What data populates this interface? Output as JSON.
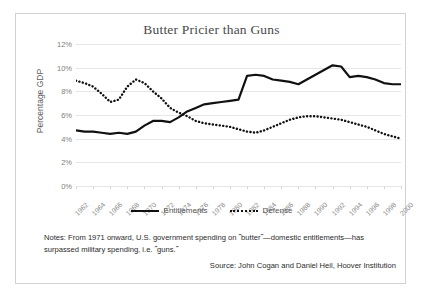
{
  "frame": {
    "border_color": "#d2d2d2"
  },
  "chart_data": {
    "type": "line",
    "title": "Butter Pricier than Guns",
    "xlabel": "",
    "ylabel": "Percentage GDP",
    "ylim": [
      0,
      12
    ],
    "ytick_labels": [
      "12%",
      "10%",
      "8%",
      "6%",
      "4%",
      "2%",
      "0%"
    ],
    "ytick_values": [
      12,
      10,
      8,
      6,
      4,
      2,
      0
    ],
    "grid": true,
    "legend_position": "bottom-center",
    "categories": [
      "1962",
      "1963",
      "1964",
      "1965",
      "1966",
      "1967",
      "1968",
      "1969",
      "1970",
      "1971",
      "1972",
      "1973",
      "1974",
      "1975",
      "1976",
      "1977",
      "1978",
      "1979",
      "1980",
      "1981",
      "1982",
      "1983",
      "1984",
      "1985",
      "1986",
      "1987",
      "1988",
      "1989",
      "1990",
      "1991",
      "1992",
      "1993",
      "1994",
      "1995",
      "1996",
      "1997",
      "1998",
      "1999",
      "2000"
    ],
    "xtick_labels": [
      "1962",
      "1964",
      "1966",
      "1968",
      "1970",
      "1972",
      "1974",
      "1976",
      "1978",
      "1980",
      "1982",
      "1984",
      "1986",
      "1988",
      "1990",
      "1992",
      "1994",
      "1996",
      "1998",
      "2000"
    ],
    "series": [
      {
        "name": "Entitlements",
        "style": "solid",
        "color": "#111111",
        "values": [
          4.7,
          4.6,
          4.6,
          4.5,
          4.4,
          4.5,
          4.4,
          4.6,
          5.1,
          5.5,
          5.5,
          5.4,
          5.8,
          6.3,
          6.6,
          6.9,
          7.0,
          7.1,
          7.2,
          7.3,
          9.3,
          9.4,
          9.3,
          9.0,
          8.9,
          8.8,
          8.6,
          9.0,
          9.4,
          9.8,
          10.2,
          10.1,
          9.2,
          9.3,
          9.2,
          9.0,
          8.7,
          8.6,
          8.6
        ]
      },
      {
        "name": "Defense",
        "style": "dotted",
        "color": "#111111",
        "values": [
          8.9,
          8.7,
          8.4,
          7.8,
          7.1,
          7.3,
          8.4,
          9.0,
          8.7,
          8.0,
          7.4,
          6.6,
          6.2,
          5.9,
          5.5,
          5.3,
          5.2,
          5.1,
          5.0,
          4.8,
          4.6,
          4.5,
          4.7,
          5.0,
          5.3,
          5.6,
          5.8,
          5.9,
          5.9,
          5.8,
          5.7,
          5.6,
          5.4,
          5.2,
          5.0,
          4.7,
          4.4,
          4.2,
          4.0
        ]
      }
    ],
    "annotations": {
      "notes": "Notes: From 1971 onward, U.S. government spending on ˝butter˝—domestic entitlements—has surpassed military spending, i.e. ˝guns.˝",
      "source": "Source: John Cogan and Daniel Heil, Hoover Institution"
    }
  }
}
